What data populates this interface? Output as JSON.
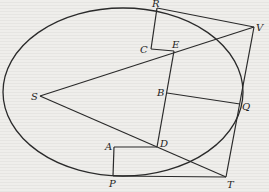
{
  "diagram": {
    "type": "geometric-figure",
    "ellipse": {
      "cx": 123,
      "cy": 92,
      "rx": 120,
      "ry": 84
    },
    "points": {
      "S": {
        "x": 40,
        "y": 96
      },
      "R": {
        "x": 157,
        "y": 8
      },
      "C": {
        "x": 151,
        "y": 49
      },
      "E": {
        "x": 174,
        "y": 51
      },
      "V": {
        "x": 254,
        "y": 27
      },
      "B": {
        "x": 167,
        "y": 93
      },
      "Q": {
        "x": 240,
        "y": 104
      },
      "D": {
        "x": 157,
        "y": 147
      },
      "A": {
        "x": 114,
        "y": 147
      },
      "P": {
        "x": 113,
        "y": 176
      },
      "T": {
        "x": 226,
        "y": 177
      }
    },
    "labels": {
      "S": "S",
      "R": "R",
      "C": "C",
      "E": "E",
      "V": "V",
      "B": "B",
      "Q": "Q",
      "D": "D",
      "A": "A",
      "P": "P",
      "T": "T"
    },
    "segments": [
      [
        "S",
        "V"
      ],
      [
        "S",
        "T"
      ],
      [
        "R",
        "V"
      ],
      [
        "V",
        "T"
      ],
      [
        "R",
        "C"
      ],
      [
        "C",
        "E"
      ],
      [
        "E",
        "D"
      ],
      [
        "B",
        "Q"
      ],
      [
        "A",
        "D"
      ],
      [
        "A",
        "P"
      ],
      [
        "P",
        "T"
      ]
    ]
  }
}
